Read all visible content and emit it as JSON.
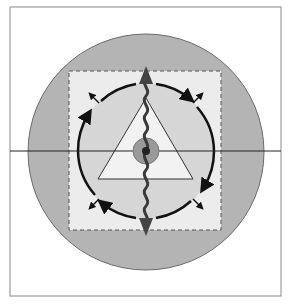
{
  "diagram": {
    "title": "",
    "colors": {
      "background": "#ffffff",
      "frame": "#8a8a8a",
      "outer_circle_fill": "#b4b4b4",
      "outer_circle_stroke": "#6a6a6a",
      "square_fill": "#ececec",
      "square_stroke": "#555555",
      "inner_circle_fill": "#d6d6d6",
      "inner_circle_stroke": "#111111",
      "triangle_fill": "#f2f2f2",
      "triangle_stroke": "#333333",
      "center_ring_fill": "#9a9a9a",
      "center_ring_stroke": "#777777",
      "center_dot": "#222222",
      "wave": "#3a3a3a",
      "axis_line": "#222222"
    },
    "elements": {
      "frame": {
        "x": 10,
        "y": 7,
        "width": 271,
        "height": 289
      },
      "outer_circle": {
        "cx": 146,
        "cy": 152,
        "r": 118
      },
      "dashed_square": {
        "x": 69,
        "y": 71,
        "width": 152,
        "height": 159
      },
      "inner_circle": {
        "cx": 146,
        "cy": 151,
        "r": 68
      },
      "triangle": {
        "points": "146,98 98,179 193,179"
      },
      "center_ring": {
        "cx": 146,
        "cy": 151,
        "r": 13
      },
      "center_dot": {
        "cx": 146,
        "cy": 151,
        "r": 4
      },
      "horizontal_axis": {
        "y": 151,
        "x1": 10,
        "x2": 281
      },
      "wave_arrow": {
        "top_y": 66,
        "bottom_y": 236,
        "x": 146
      }
    }
  }
}
